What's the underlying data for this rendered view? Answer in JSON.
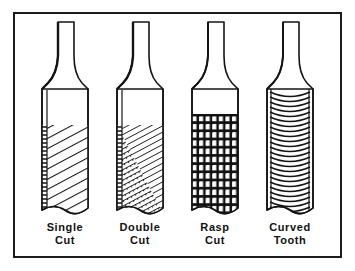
{
  "figure": {
    "background_color": "#ffffff",
    "frame": {
      "border_color": "#1b1b1b",
      "border_width": 2,
      "x": 13,
      "y": 12,
      "width": 329,
      "height": 246
    },
    "ink_color": "#111111",
    "items": [
      {
        "id": "single-cut",
        "label_line1": "Single",
        "label_line2": "Cut",
        "pattern": "single-diagonal-hatch",
        "blade_left": 42,
        "blade_right": 88,
        "blade_top": 89,
        "blade_bottom": 213,
        "hatch_start_y": 125,
        "tang_top_y": 22,
        "tang_top_left": 58,
        "tang_top_right": 74
      },
      {
        "id": "double-cut",
        "label_line1": "Double",
        "label_line2": "Cut",
        "pattern": "double-cross-hatch",
        "blade_left": 117,
        "blade_right": 163,
        "blade_top": 89,
        "blade_bottom": 213,
        "hatch_start_y": 125,
        "tang_top_y": 22,
        "tang_top_left": 133,
        "tang_top_right": 149
      },
      {
        "id": "rasp-cut",
        "label_line1": "Rasp",
        "label_line2": "Cut",
        "pattern": "rasp-teeth",
        "blade_left": 192,
        "blade_right": 238,
        "blade_top": 89,
        "blade_bottom": 213,
        "hatch_start_y": 114,
        "tang_top_y": 22,
        "tang_top_left": 208,
        "tang_top_right": 224
      },
      {
        "id": "curved-tooth",
        "label_line1": "Curved",
        "label_line2": "Tooth",
        "pattern": "curved-arcs",
        "blade_left": 267,
        "blade_right": 313,
        "blade_top": 89,
        "blade_bottom": 213,
        "hatch_start_y": 89,
        "tang_top_y": 22,
        "tang_top_left": 283,
        "tang_top_right": 299
      }
    ]
  }
}
